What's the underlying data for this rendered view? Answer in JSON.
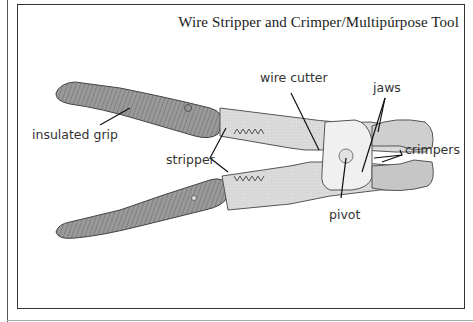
{
  "diagram": {
    "title": "Wire Stripper and Crimper/Multipúrpose Tool",
    "labels": {
      "insulated_grip": "insulated grip",
      "stripper": "stripper",
      "wire_cutter": "wire cutter",
      "jaws": "jaws",
      "crimpers": "crimpers",
      "pivot": "pivot"
    },
    "colors": {
      "frame": "#333333",
      "text": "#333333",
      "grip_shade": "#8a8a8a",
      "metal": "#d8d8d8"
    }
  }
}
